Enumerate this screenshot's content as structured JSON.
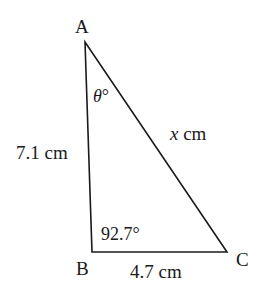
{
  "diagram": {
    "type": "triangle",
    "vertices": {
      "A": {
        "label": "A",
        "x": 85,
        "y": 42
      },
      "B": {
        "label": "B",
        "x": 92,
        "y": 252
      },
      "C": {
        "label": "C",
        "x": 227,
        "y": 252
      }
    },
    "sides": {
      "AB": "7.1 cm",
      "BC": "4.7 cm",
      "AC": "x cm"
    },
    "angles": {
      "A": "θ°",
      "B": "92.7°"
    },
    "colors": {
      "stroke": "#1a1a1a",
      "background": "#ffffff"
    }
  }
}
